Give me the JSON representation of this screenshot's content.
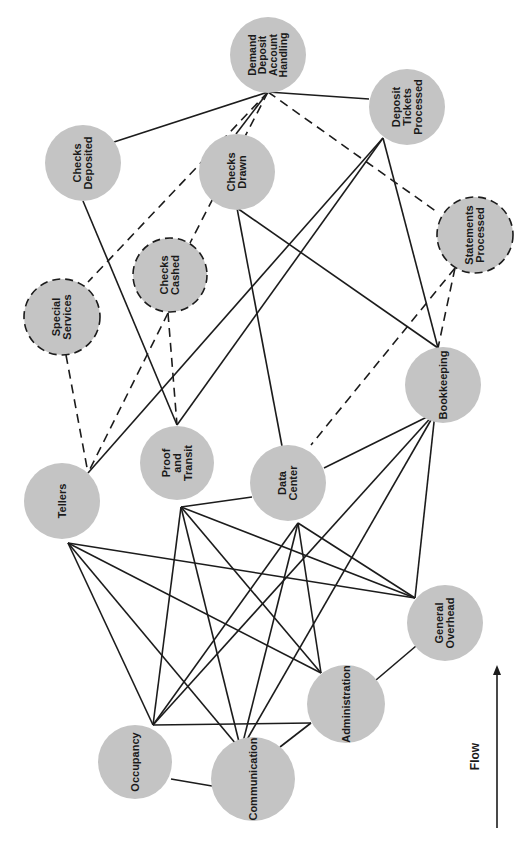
{
  "diagram": {
    "orientation": "rotated-90-ccw",
    "colors": {
      "node_fill": "#c4c4c4",
      "edge": "#1c1c1c",
      "text": "#1a1a1a",
      "background": "#ffffff"
    },
    "nodes": [
      {
        "id": "dda",
        "lines": [
          "Demand",
          "Deposit",
          "Account",
          "Handling"
        ],
        "cx": 268,
        "cy": 55,
        "r": 38,
        "style": "solid"
      },
      {
        "id": "dtp",
        "lines": [
          "Deposit",
          "Tickets",
          "Processed"
        ],
        "cx": 407,
        "cy": 107,
        "r": 38,
        "style": "solid"
      },
      {
        "id": "cdep",
        "lines": [
          "Checks",
          "Deposited"
        ],
        "cx": 83,
        "cy": 163,
        "r": 38,
        "style": "solid"
      },
      {
        "id": "cdrawn",
        "lines": [
          "Checks",
          "Drawn"
        ],
        "cx": 237,
        "cy": 172,
        "r": 38,
        "style": "solid"
      },
      {
        "id": "stmt",
        "lines": [
          "Statements",
          "Processed"
        ],
        "cx": 475,
        "cy": 235,
        "r": 38,
        "style": "dashed"
      },
      {
        "id": "ccashed",
        "lines": [
          "Checks",
          "Cashed"
        ],
        "cx": 170,
        "cy": 275,
        "r": 37,
        "style": "dashed"
      },
      {
        "id": "special",
        "lines": [
          "Special",
          "Services"
        ],
        "cx": 62,
        "cy": 317,
        "r": 38,
        "style": "dashed"
      },
      {
        "id": "bookkeeping",
        "lines": [
          "Bookkeeping"
        ],
        "cx": 443,
        "cy": 385,
        "r": 38,
        "style": "solid"
      },
      {
        "id": "tellers",
        "lines": [
          "Tellers"
        ],
        "cx": 62,
        "cy": 501,
        "r": 38,
        "style": "solid"
      },
      {
        "id": "pt",
        "lines": [
          "Proof",
          "and",
          "Transit"
        ],
        "cx": 177,
        "cy": 463,
        "r": 37,
        "style": "solid"
      },
      {
        "id": "dc",
        "lines": [
          "Data",
          "Center"
        ],
        "cx": 288,
        "cy": 483,
        "r": 38,
        "style": "solid"
      },
      {
        "id": "go",
        "lines": [
          "General",
          "Overhead"
        ],
        "cx": 445,
        "cy": 623,
        "r": 38,
        "style": "solid"
      },
      {
        "id": "admin",
        "lines": [
          "Administration"
        ],
        "cx": 346,
        "cy": 704,
        "r": 39,
        "style": "solid"
      },
      {
        "id": "occupancy",
        "lines": [
          "Occupancy"
        ],
        "cx": 135,
        "cy": 762,
        "r": 37,
        "style": "solid"
      },
      {
        "id": "comm",
        "lines": [
          "Communication"
        ],
        "cx": 253,
        "cy": 779,
        "r": 42,
        "style": "solid"
      }
    ],
    "edges": [
      {
        "from": "dda",
        "to": "cdep",
        "style": "solid",
        "x1": 268,
        "y1": 92,
        "x2": 114,
        "y2": 142
      },
      {
        "from": "dda",
        "to": "cdrawn",
        "style": "solid",
        "x1": 268,
        "y1": 92,
        "x2": 236,
        "y2": 134
      },
      {
        "from": "dda",
        "to": "dtp",
        "style": "solid",
        "x1": 268,
        "y1": 92,
        "x2": 369,
        "y2": 99
      },
      {
        "from": "dda",
        "to": "special",
        "style": "dashed",
        "x1": 268,
        "y1": 92,
        "x2": 88,
        "y2": 282
      },
      {
        "from": "dda",
        "to": "ccashed",
        "style": "dashed",
        "x1": 268,
        "y1": 92,
        "x2": 190,
        "y2": 243
      },
      {
        "from": "dda",
        "to": "stmt",
        "style": "dashed",
        "x1": 268,
        "y1": 92,
        "x2": 437,
        "y2": 212
      },
      {
        "from": "dtp",
        "to": "tellers",
        "style": "solid",
        "x1": 383,
        "y1": 138,
        "x2": 88,
        "y2": 473
      },
      {
        "from": "dtp",
        "to": "pt",
        "style": "solid",
        "x1": 383,
        "y1": 138,
        "x2": 177,
        "y2": 425
      },
      {
        "from": "dtp",
        "to": "bookkeeping",
        "style": "solid",
        "x1": 383,
        "y1": 138,
        "x2": 438,
        "y2": 348
      },
      {
        "from": "cdep",
        "to": "pt",
        "style": "solid",
        "x1": 83,
        "y1": 201,
        "x2": 177,
        "y2": 425
      },
      {
        "from": "cdrawn",
        "to": "dc",
        "style": "solid",
        "x1": 237,
        "y1": 208,
        "x2": 282,
        "y2": 446
      },
      {
        "from": "cdrawn",
        "to": "bookkeeping",
        "style": "solid",
        "x1": 237,
        "y1": 208,
        "x2": 438,
        "y2": 348
      },
      {
        "from": "ccashed",
        "to": "tellers",
        "style": "dashed",
        "x1": 168,
        "y1": 313,
        "x2": 88,
        "y2": 473
      },
      {
        "from": "ccashed",
        "to": "pt",
        "style": "dashed",
        "x1": 168,
        "y1": 313,
        "x2": 177,
        "y2": 425
      },
      {
        "from": "special",
        "to": "tellers",
        "style": "dashed",
        "x1": 66,
        "y1": 355,
        "x2": 88,
        "y2": 473
      },
      {
        "from": "stmt",
        "to": "dc",
        "style": "dashed",
        "x1": 455,
        "y1": 268,
        "x2": 311,
        "y2": 445
      },
      {
        "from": "stmt",
        "to": "bookkeeping",
        "style": "dashed",
        "x1": 455,
        "y1": 268,
        "x2": 438,
        "y2": 348
      },
      {
        "from": "bookkeeping",
        "to": "dc",
        "style": "solid",
        "x1": 435,
        "y1": 413,
        "x2": 324,
        "y2": 468
      },
      {
        "from": "bookkeeping",
        "to": "go",
        "style": "solid",
        "x1": 435,
        "y1": 413,
        "x2": 415,
        "y2": 598
      },
      {
        "from": "bookkeeping",
        "to": "occupancy",
        "style": "solid",
        "x1": 435,
        "y1": 413,
        "x2": 153,
        "y2": 725
      },
      {
        "from": "bookkeeping",
        "to": "comm",
        "style": "solid",
        "x1": 435,
        "y1": 413,
        "x2": 241,
        "y2": 750
      },
      {
        "from": "pt",
        "to": "dc",
        "style": "solid",
        "x1": 181,
        "y1": 507,
        "x2": 252,
        "y2": 497
      },
      {
        "from": "pt",
        "to": "go",
        "style": "solid",
        "x1": 181,
        "y1": 507,
        "x2": 415,
        "y2": 598
      },
      {
        "from": "pt",
        "to": "admin",
        "style": "solid",
        "x1": 181,
        "y1": 507,
        "x2": 321,
        "y2": 673
      },
      {
        "from": "pt",
        "to": "occupancy",
        "style": "solid",
        "x1": 181,
        "y1": 507,
        "x2": 153,
        "y2": 725
      },
      {
        "from": "pt",
        "to": "comm",
        "style": "solid",
        "x1": 181,
        "y1": 507,
        "x2": 241,
        "y2": 750
      },
      {
        "from": "tellers",
        "to": "go",
        "style": "solid",
        "x1": 68,
        "y1": 543,
        "x2": 415,
        "y2": 598
      },
      {
        "from": "tellers",
        "to": "admin",
        "style": "solid",
        "x1": 68,
        "y1": 543,
        "x2": 321,
        "y2": 673
      },
      {
        "from": "tellers",
        "to": "occupancy",
        "style": "solid",
        "x1": 68,
        "y1": 543,
        "x2": 153,
        "y2": 725
      },
      {
        "from": "tellers",
        "to": "comm",
        "style": "solid",
        "x1": 68,
        "y1": 543,
        "x2": 241,
        "y2": 750
      },
      {
        "from": "dc",
        "to": "go",
        "style": "solid",
        "x1": 298,
        "y1": 523,
        "x2": 415,
        "y2": 598
      },
      {
        "from": "dc",
        "to": "admin",
        "style": "solid",
        "x1": 298,
        "y1": 523,
        "x2": 321,
        "y2": 673
      },
      {
        "from": "dc",
        "to": "occupancy",
        "style": "solid",
        "x1": 298,
        "y1": 523,
        "x2": 153,
        "y2": 725
      },
      {
        "from": "dc",
        "to": "comm",
        "style": "solid",
        "x1": 298,
        "y1": 523,
        "x2": 241,
        "y2": 750
      },
      {
        "from": "go",
        "to": "admin",
        "style": "solid",
        "x1": 416,
        "y1": 646,
        "x2": 376,
        "y2": 680
      },
      {
        "from": "admin",
        "to": "occupancy",
        "style": "solid",
        "x1": 311,
        "y1": 723,
        "x2": 153,
        "y2": 725
      },
      {
        "from": "admin",
        "to": "comm",
        "style": "solid",
        "x1": 311,
        "y1": 723,
        "x2": 280,
        "y2": 747
      },
      {
        "from": "occupancy",
        "to": "comm",
        "style": "solid",
        "x1": 171,
        "y1": 779,
        "x2": 212,
        "y2": 786
      }
    ],
    "flow": {
      "label": "Flow",
      "x": 497,
      "y_top": 665,
      "y_bottom": 828
    }
  }
}
